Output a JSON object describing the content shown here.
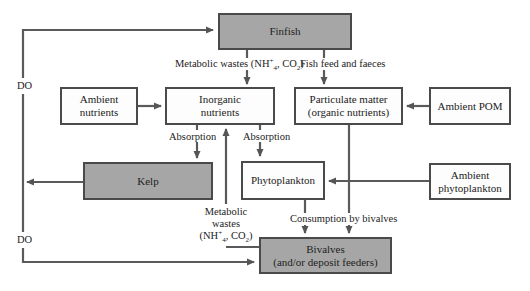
{
  "diagram": {
    "boxes": {
      "finfish": "Finfish",
      "ambient_nutrients_1": "Ambient",
      "ambient_nutrients_2": "nutrients",
      "inorganic_nutrients_1": "Inorganic",
      "inorganic_nutrients_2": "nutrients",
      "particulate_matter_1": "Particulate matter",
      "particulate_matter_2": "(organic nutrients)",
      "ambient_pom": "Ambient POM",
      "kelp": "Kelp",
      "phytoplankton": "Phytoplankton",
      "ambient_phytoplankton_1": "Ambient",
      "ambient_phytoplankton_2": "phytoplankton",
      "bivalves_1": "Bivalves",
      "bivalves_2": "(and/or deposit feeders)"
    },
    "labels": {
      "do_top": "DO",
      "do_bottom": "DO",
      "metabolic_wastes_finfish_prefix": "Metabolic wastes (NH",
      "nh4_sup": "+",
      "nh4_sub": "4",
      "co2_mid": ", CO",
      "co2_sub": "2",
      "close_paren": ")",
      "fish_feed": "Fish feed and faeces",
      "absorption_left": "Absorption",
      "absorption_right": "Absorption",
      "metabolic_1": "Metabolic",
      "metabolic_2": "wastes",
      "metabolic_3_prefix": "(NH",
      "consumption": "Consumption by bivalves"
    },
    "colors": {
      "line": "#555555",
      "gray_fill": "#a6a6a6",
      "box_border": "#4a4a4a"
    }
  }
}
